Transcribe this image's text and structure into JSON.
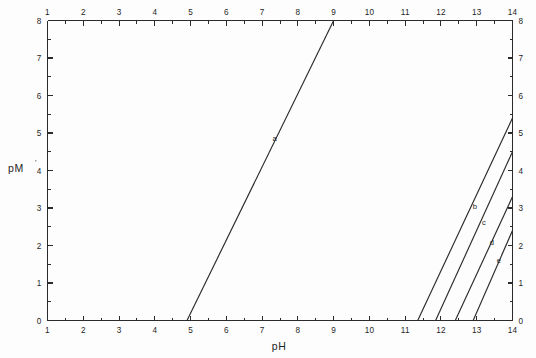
{
  "chart_data": {
    "type": "line",
    "title": "",
    "xlabel": "pH",
    "ylabel": "pM",
    "ylabel_superscript": "'",
    "xlim": [
      1,
      14
    ],
    "ylim": [
      0,
      8
    ],
    "x_ticks": [
      1,
      2,
      3,
      4,
      5,
      6,
      7,
      8,
      9,
      10,
      11,
      12,
      13,
      14
    ],
    "y_ticks": [
      0,
      1,
      2,
      3,
      4,
      5,
      6,
      7,
      8
    ],
    "x_tick_labels": [
      "1",
      "2",
      "3",
      "4",
      "5",
      "6",
      "7",
      "8",
      "9",
      "10",
      "11",
      "12",
      "13",
      "14"
    ],
    "y_tick_labels": [
      "0",
      "1",
      "2",
      "3",
      "4",
      "5",
      "6",
      "7",
      "8"
    ],
    "minor_tick_step": 0.5,
    "grid": false,
    "legend": "inline-labels",
    "axes_mirrored": true,
    "series": [
      {
        "name": "a",
        "label": "a",
        "x": [
          4.9,
          9.0
        ],
        "y": [
          0.0,
          8.0
        ],
        "label_x": 7.35,
        "label_y": 4.85
      },
      {
        "name": "b",
        "label": "b",
        "x": [
          11.35,
          14.0
        ],
        "y": [
          0.0,
          5.4
        ],
        "label_x": 12.95,
        "label_y": 3.05
      },
      {
        "name": "c",
        "label": "c",
        "x": [
          11.85,
          14.0
        ],
        "y": [
          0.0,
          4.5
        ],
        "label_x": 13.2,
        "label_y": 2.62
      },
      {
        "name": "d",
        "label": "d",
        "x": [
          12.4,
          14.0
        ],
        "y": [
          0.0,
          3.3
        ],
        "label_x": 13.42,
        "label_y": 2.08
      },
      {
        "name": "e",
        "label": "e",
        "x": [
          12.9,
          14.0
        ],
        "y": [
          0.0,
          2.4
        ],
        "label_x": 13.62,
        "label_y": 1.6
      }
    ]
  },
  "figure": {
    "background_color": "#fdfdfd",
    "line_color": "#2a2a2a",
    "text_color": "#1f1f1f"
  }
}
